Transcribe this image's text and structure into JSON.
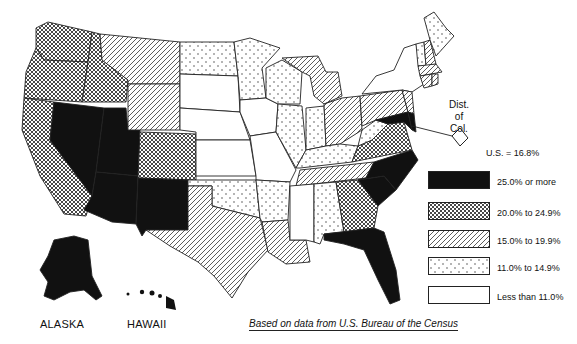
{
  "map": {
    "subject": "Percent of population by state (U.S. choropleth)",
    "us_value_label": "U.S. = 16.8%",
    "source": "Based on data from U.S. Bureau of the Census",
    "inset_labels": {
      "alaska": "ALASKA",
      "hawaii": "HAWAII"
    },
    "dc_label_lines": [
      "Dist.",
      "of",
      "Col."
    ],
    "legend": [
      {
        "id": "c5",
        "label": "25.0% or more",
        "pattern": "solid-black"
      },
      {
        "id": "c4",
        "label": "20.0% to 24.9%",
        "pattern": "crosshatch"
      },
      {
        "id": "c3",
        "label": "15.0% to 19.9%",
        "pattern": "diagonal"
      },
      {
        "id": "c2",
        "label": "11.0% to 14.9%",
        "pattern": "dots"
      },
      {
        "id": "c1",
        "label": "Less than 11.0%",
        "pattern": "white"
      }
    ],
    "states": {
      "c5": [
        "NV",
        "UT",
        "AZ",
        "NM",
        "NC",
        "FL",
        "MD",
        "DE",
        "AK",
        "HI"
      ],
      "c4": [
        "WA",
        "OR",
        "ID",
        "CA",
        "CO",
        "GA",
        "VA"
      ],
      "c3": [
        "MT",
        "WY",
        "TX",
        "LA",
        "MI",
        "OH",
        "PA",
        "TN",
        "NH",
        "MA",
        "CT",
        "RI",
        "NJ"
      ],
      "c2": [
        "ND",
        "MN",
        "WI",
        "IL",
        "IN",
        "OK",
        "AR",
        "AL",
        "ME",
        "VT",
        "KY",
        "WV"
      ],
      "c1": [
        "SD",
        "NE",
        "KS",
        "IA",
        "MO",
        "MS",
        "NY",
        "SC",
        "DC"
      ]
    }
  }
}
